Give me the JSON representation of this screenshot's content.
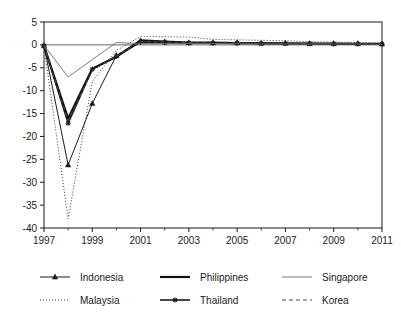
{
  "figure": {
    "title": "",
    "background": "#ffffff",
    "ink_color": "#1a1a1a"
  },
  "chart_data": {
    "type": "line",
    "title": "",
    "xlabel": "",
    "ylabel": "",
    "xlim": [
      1997,
      2011
    ],
    "ylim": [
      -40,
      5
    ],
    "grid": false,
    "legend_position": "bottom",
    "x": [
      1997,
      1998,
      1999,
      2000,
      2001,
      2002,
      2003,
      2004,
      2005,
      2006,
      2007,
      2008,
      2009,
      2010,
      2011
    ],
    "xtick_labels": [
      "1997",
      "1999",
      "2001",
      "2003",
      "2005",
      "2007",
      "2009",
      "2011"
    ],
    "xtick_values": [
      1997,
      1999,
      2001,
      2003,
      2005,
      2007,
      2009,
      2011
    ],
    "xtick_minor_values": [
      1998,
      2000,
      2002,
      2004,
      2006,
      2008,
      2010
    ],
    "ytick_labels": [
      "5",
      "0",
      "-5",
      "-10",
      "-15",
      "-20",
      "-25",
      "-30",
      "-35",
      "-40"
    ],
    "ytick_values": [
      5,
      0,
      -5,
      -10,
      -15,
      -20,
      -25,
      -30,
      -35,
      -40
    ],
    "series": [
      {
        "name": "Indonesia",
        "style": "solid-marker-triangle",
        "color": "#1a1a1a",
        "width": 1.0,
        "marker": "triangle",
        "values": [
          -0.2,
          -26.2,
          -12.8,
          -2.3,
          0.9,
          0.7,
          0.5,
          0.5,
          0.5,
          0.4,
          0.4,
          0.3,
          0.3,
          0.3,
          0.2
        ]
      },
      {
        "name": "Malaysia",
        "style": "dotted",
        "color": "#333333",
        "width": 1.0,
        "marker": "none",
        "values": [
          -0.3,
          -38.0,
          -8.0,
          -1.2,
          1.8,
          1.8,
          1.7,
          1.2,
          1.1,
          1.0,
          0.9,
          0.7,
          0.6,
          0.5,
          0.4
        ]
      },
      {
        "name": "Philippines",
        "style": "solid-thick",
        "color": "#111111",
        "width": 2.2,
        "marker": "none",
        "values": [
          -0.2,
          -16.1,
          -5.2,
          -2.6,
          1.0,
          0.7,
          0.5,
          0.5,
          0.4,
          0.4,
          0.3,
          0.3,
          0.3,
          0.2,
          0.2
        ]
      },
      {
        "name": "Thailand",
        "style": "solid-marker-star",
        "color": "#1a1a1a",
        "width": 1.6,
        "marker": "star",
        "values": [
          -0.2,
          -17.1,
          -5.3,
          -2.5,
          0.6,
          0.5,
          0.4,
          0.4,
          0.4,
          0.3,
          0.3,
          0.3,
          0.2,
          0.2,
          0.2
        ]
      },
      {
        "name": "Singapore",
        "style": "solid-thin-gray",
        "color": "#6b6b6b",
        "width": 0.9,
        "marker": "none",
        "values": [
          -0.1,
          -7.0,
          -3.2,
          0.5,
          0.3,
          0.3,
          0.3,
          0.3,
          0.3,
          0.2,
          0.2,
          0.2,
          0.2,
          0.2,
          0.1
        ]
      },
      {
        "name": "Korea",
        "style": "dashed",
        "color": "#4d4d4d",
        "width": 1.0,
        "marker": "none",
        "values": [
          -0.2,
          -16.5,
          -5.6,
          -2.4,
          0.7,
          0.6,
          0.5,
          0.4,
          0.4,
          0.4,
          0.3,
          0.3,
          0.2,
          0.2,
          0.2
        ]
      }
    ]
  },
  "legend": {
    "entries": [
      {
        "label": "Indonesia",
        "series": "Indonesia"
      },
      {
        "label": "Philippines",
        "series": "Philippines"
      },
      {
        "label": "Singapore",
        "series": "Singapore"
      },
      {
        "label": "Malaysia",
        "series": "Malaysia"
      },
      {
        "label": "Thailand",
        "series": "Thailand"
      },
      {
        "label": "Korea",
        "series": "Korea"
      }
    ]
  }
}
